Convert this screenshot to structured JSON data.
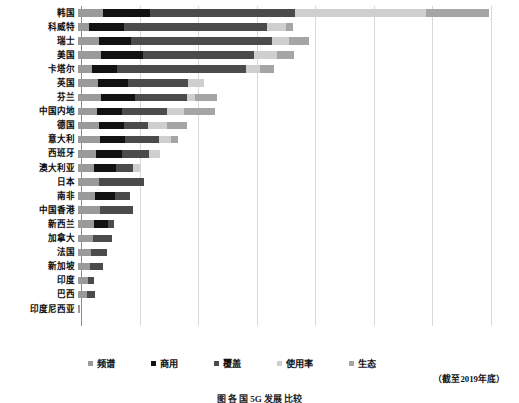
{
  "chart_data": {
    "type": "bar",
    "orientation": "horizontal",
    "stacked": true,
    "title": "",
    "xlabel": "",
    "ylabel": "",
    "grid": true,
    "gridlines": 7,
    "legend_position": "bottom",
    "note": "（截至2019年底）",
    "caption": "图  各 国  5G 发展 比较",
    "xlim": [
      0,
      100
    ],
    "categories": [
      "韩国",
      "科威特",
      "瑞士",
      "美国",
      "卡塔尔",
      "英国",
      "芬兰",
      "中国内地",
      "德国",
      "意大利",
      "西班牙",
      "澳大利亚",
      "日本",
      "南非",
      "中国香港",
      "新西兰",
      "加拿大",
      "法国",
      "新加坡",
      "印度",
      "巴西",
      "印度尼西亚"
    ],
    "series": [
      {
        "name": "频谱",
        "color": "#9a9a9a",
        "values": [
          6.1,
          2.7,
          5.1,
          5.6,
          3.5,
          4.9,
          5.6,
          4.6,
          5.1,
          5.3,
          4.5,
          4.0,
          5.1,
          4.1,
          5.4,
          3.9,
          3.6,
          3.1,
          3.0,
          2.4,
          2.3,
          0.6
        ]
      },
      {
        "name": "商用",
        "color": "#121212",
        "values": [
          11.5,
          8.4,
          7.8,
          10.3,
          5.9,
          7.4,
          8.2,
          6.2,
          6.0,
          6.1,
          6.3,
          5.2,
          0.0,
          5.0,
          0.0,
          3.5,
          0.0,
          0.0,
          0.0,
          0.0,
          0.0,
          0.0
        ]
      },
      {
        "name": "覆盖",
        "color": "#4b4b4b",
        "values": [
          35.4,
          34.9,
          34.3,
          27.0,
          31.6,
          14.5,
          12.8,
          11.0,
          5.9,
          8.4,
          6.6,
          4.2,
          11.0,
          3.6,
          8.1,
          1.5,
          4.6,
          4.0,
          3.0,
          1.5,
          1.8,
          0.0
        ]
      },
      {
        "name": "使用率",
        "color": "#cfcfcf",
        "values": [
          32.0,
          4.8,
          4.2,
          5.7,
          3.4,
          4.0,
          2.0,
          4.0,
          4.8,
          2.9,
          2.5,
          1.8,
          0.0,
          0.0,
          0.0,
          0.0,
          0.0,
          0.0,
          0.0,
          0.0,
          0.0,
          0.0
        ]
      },
      {
        "name": "生态",
        "color": "#a5a5a5",
        "values": [
          15.2,
          1.7,
          5.0,
          4.0,
          3.3,
          0.0,
          5.3,
          7.5,
          4.7,
          1.7,
          0.0,
          0.0,
          0.0,
          0.0,
          0.0,
          0.0,
          0.0,
          0.0,
          0.0,
          0.0,
          0.0,
          0.0
        ]
      }
    ],
    "totals": [
      100.2,
      52.5,
      56.4,
      52.6,
      47.7,
      30.8,
      33.9,
      33.3,
      26.5,
      24.4,
      19.9,
      15.2,
      16.1,
      12.7,
      13.5,
      8.9,
      8.2,
      7.1,
      6.0,
      3.9,
      4.1,
      0.6
    ]
  },
  "legend": {
    "items": [
      {
        "label": "频谱",
        "color": "#9a9a9a"
      },
      {
        "label": "商用",
        "color": "#121212"
      },
      {
        "label": "覆盖",
        "color": "#4b4b4b"
      },
      {
        "label": "使用率",
        "color": "#cfcfcf"
      },
      {
        "label": "生态",
        "color": "#a5a5a5"
      }
    ]
  }
}
